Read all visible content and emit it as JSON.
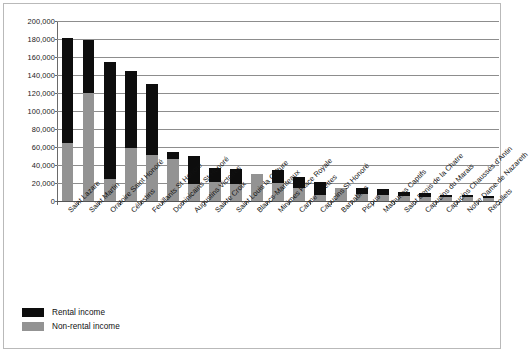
{
  "chart_data": {
    "type": "bar",
    "subtype": "stacked-vertical",
    "title": "",
    "xlabel": "",
    "ylabel": "",
    "ylim": [
      0,
      200000
    ],
    "ytick_step": 20000,
    "ytick_labels": [
      "0",
      "20,000",
      "40,000",
      "60,000",
      "80,000",
      "100,000",
      "120,000",
      "140,000",
      "160,000",
      "180,000",
      "200,000"
    ],
    "ytick_values": [
      0,
      20000,
      40000,
      60000,
      80000,
      100000,
      120000,
      140000,
      160000,
      180000,
      200000
    ],
    "grid": true,
    "grid_axis": "y",
    "legend_position": "bottom-left",
    "categories": [
      "Saint Lazare",
      "Saint Martin",
      "Oratoire Saint Honoré",
      "Célestins",
      "Feuillants St Honoré",
      "Dominicains St Honoré",
      "Augustins Victoires",
      "Sainte Croix",
      "Saint Louis la Culture",
      "Blancs-Manteaux",
      "Minimes Place Royale",
      "Carme Billettes",
      "Capucins St Honoré",
      "Barnabites",
      "Picpus",
      "Mathurins Captifs",
      "Saint Denis de la Chatre",
      "Capucins du Marais",
      "Capucins Chaussés d'Antin",
      "Notre Dame de Nazareth",
      "Recollets"
    ],
    "series": [
      {
        "name": "Non-rental income",
        "color": "#939393",
        "values": [
          65000,
          120000,
          25000,
          59000,
          51000,
          47000,
          19000,
          21000,
          19000,
          30000,
          20000,
          15000,
          7000,
          14000,
          8000,
          7000,
          6000,
          5000,
          4000,
          4000,
          3500
        ]
      },
      {
        "name": "Rental income",
        "color": "#0d0d0d",
        "values": [
          116000,
          59000,
          130000,
          86000,
          79000,
          8000,
          31000,
          16000,
          17000,
          0,
          14000,
          12000,
          14000,
          0,
          6000,
          6000,
          4000,
          4000,
          3000,
          2500,
          2000
        ]
      }
    ],
    "totals": [
      181000,
      179000,
      155000,
      145000,
      130000,
      55000,
      50000,
      37000,
      36000,
      30000,
      34000,
      27000,
      21000,
      14000,
      14000,
      13000,
      10000,
      9000,
      7000,
      6500,
      5500
    ]
  },
  "legend": {
    "items": [
      {
        "label": "Rental income",
        "color": "#0d0d0d"
      },
      {
        "label": "Non-rental income",
        "color": "#939393"
      }
    ]
  }
}
